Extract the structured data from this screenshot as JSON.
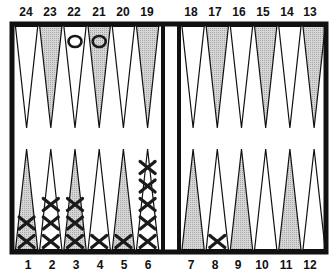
{
  "board": {
    "top_labels_left": [
      "24",
      "23",
      "22",
      "21",
      "20",
      "19"
    ],
    "top_labels_right": [
      "18",
      "17",
      "16",
      "15",
      "14",
      "13"
    ],
    "bottom_labels_left": [
      "1",
      "2",
      "3",
      "4",
      "5",
      "6"
    ],
    "bottom_labels_right": [
      "7",
      "8",
      "9",
      "10",
      "11",
      "12"
    ],
    "colors": {
      "frame": "#111111",
      "shaded_point": "#c8c8c8",
      "light_point": "#ffffff",
      "checker_ink": "#1a1a1a"
    }
  },
  "checkers": {
    "O": [
      {
        "point": 22,
        "count": 1
      },
      {
        "point": 21,
        "count": 1
      }
    ],
    "X": [
      {
        "point": 1,
        "count": 2
      },
      {
        "point": 2,
        "count": 3
      },
      {
        "point": 3,
        "count": 3
      },
      {
        "point": 4,
        "count": 1
      },
      {
        "point": 5,
        "count": 1
      },
      {
        "point": 6,
        "count": 5
      },
      {
        "point": 8,
        "count": 1
      }
    ]
  }
}
